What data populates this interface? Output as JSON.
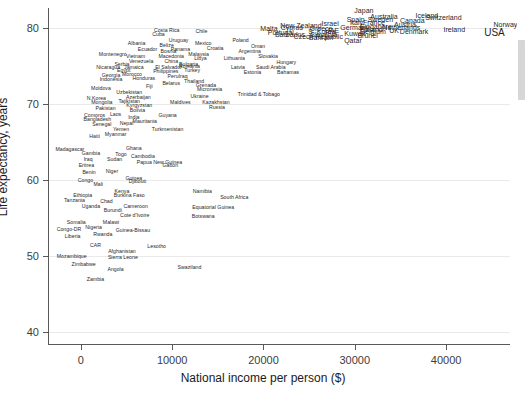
{
  "chart_data": {
    "type": "scatter",
    "title": "",
    "xlabel": "National income per person ($)",
    "ylabel": "Life expectancy, years",
    "xlim": [
      -3600,
      47000
    ],
    "ylim": [
      38.3,
      82.6
    ],
    "xticks": [
      0,
      10000,
      20000,
      30000,
      40000
    ],
    "xtick_labels": [
      "0",
      "10000",
      "20000",
      "30000",
      "40000"
    ],
    "yticks": [
      40,
      50,
      60,
      70,
      80
    ],
    "ytick_labels": [
      "40",
      "50",
      "60",
      "70",
      "80"
    ],
    "grid": "horizontal",
    "legend": "none",
    "point_render": "text-labels-only",
    "points": [
      {
        "label": "Japan",
        "x": 31000,
        "y": 82.2,
        "size": "mid"
      },
      {
        "label": "Iceland",
        "x": 37900,
        "y": 81.6,
        "size": "mid"
      },
      {
        "label": "Australia",
        "x": 33200,
        "y": 81.4,
        "size": "mid"
      },
      {
        "label": "Switzerland",
        "x": 39700,
        "y": 81.3,
        "size": "mid"
      },
      {
        "label": "Spain",
        "x": 30100,
        "y": 81.0,
        "size": "mid"
      },
      {
        "label": "Sweden",
        "x": 32800,
        "y": 81.0,
        "size": "mid"
      },
      {
        "label": "Canada",
        "x": 36300,
        "y": 80.9,
        "size": "mid"
      },
      {
        "label": "Italy",
        "x": 30200,
        "y": 80.6,
        "size": "mid"
      },
      {
        "label": "France",
        "x": 32100,
        "y": 80.6,
        "size": "mid"
      },
      {
        "label": "Israel",
        "x": 27300,
        "y": 80.5,
        "size": "mid"
      },
      {
        "label": "Austria",
        "x": 35500,
        "y": 80.4,
        "size": "mid"
      },
      {
        "label": "Norway",
        "x": 46500,
        "y": 80.3,
        "size": "mid"
      },
      {
        "label": "Singapore",
        "x": 32300,
        "y": 80.1,
        "size": "mid"
      },
      {
        "label": "Germany",
        "x": 30000,
        "y": 80.0,
        "size": "mid"
      },
      {
        "label": "Netherlands",
        "x": 35100,
        "y": 80.0,
        "size": "mid"
      },
      {
        "label": "New Zealand",
        "x": 24100,
        "y": 80.2,
        "size": "mid"
      },
      {
        "label": "Greece",
        "x": 26300,
        "y": 79.9,
        "size": "mid"
      },
      {
        "label": "Finland",
        "x": 31800,
        "y": 79.7,
        "size": "mid"
      },
      {
        "label": "Ireland",
        "x": 40900,
        "y": 79.7,
        "size": "mid"
      },
      {
        "label": "USA",
        "x": 45300,
        "y": 79.4,
        "size": "big"
      },
      {
        "label": "Cyprus",
        "x": 23100,
        "y": 80.0,
        "size": "mid"
      },
      {
        "label": "Malta",
        "x": 20600,
        "y": 79.9,
        "size": "mid"
      },
      {
        "label": "UK",
        "x": 34300,
        "y": 79.6,
        "size": "mid"
      },
      {
        "label": "Denmark",
        "x": 36500,
        "y": 79.4,
        "size": "mid"
      },
      {
        "label": "UAE",
        "x": 27500,
        "y": 79.6,
        "size": "mid"
      },
      {
        "label": "Belgium",
        "x": 32000,
        "y": 79.4,
        "size": "mid"
      },
      {
        "label": "S. Korea",
        "x": 26400,
        "y": 79.4,
        "size": "mid"
      },
      {
        "label": "Kuwait",
        "x": 30000,
        "y": 79.2,
        "size": "mid"
      },
      {
        "label": "Portugal",
        "x": 21900,
        "y": 79.3,
        "size": "mid"
      },
      {
        "label": "Slovenia",
        "x": 26600,
        "y": 79.0,
        "size": "mid"
      },
      {
        "label": "Brunei",
        "x": 31400,
        "y": 78.9,
        "size": "mid"
      },
      {
        "label": "Czech Republic",
        "x": 26000,
        "y": 78.8,
        "size": "mid"
      },
      {
        "label": "Barbados",
        "x": 22900,
        "y": 79.1,
        "size": "mid"
      },
      {
        "label": "Bahrain",
        "x": 26300,
        "y": 78.6,
        "size": "mid"
      },
      {
        "label": "Qatar",
        "x": 29800,
        "y": 78.3,
        "size": "mid"
      },
      {
        "label": "Chile",
        "x": 13200,
        "y": 79.6,
        "size": "small"
      },
      {
        "label": "Costa Rica",
        "x": 9400,
        "y": 79.7,
        "size": "small"
      },
      {
        "label": "Cuba",
        "x": 8500,
        "y": 79.2,
        "size": "small"
      },
      {
        "label": "Uruguay",
        "x": 10700,
        "y": 78.4,
        "size": "small"
      },
      {
        "label": "Poland",
        "x": 17500,
        "y": 78.4,
        "size": "small"
      },
      {
        "label": "Albania",
        "x": 6100,
        "y": 78.0,
        "size": "small"
      },
      {
        "label": "Mexico",
        "x": 13400,
        "y": 78.0,
        "size": "small"
      },
      {
        "label": "Belize",
        "x": 9400,
        "y": 77.7,
        "size": "small"
      },
      {
        "label": "Oman",
        "x": 19400,
        "y": 77.6,
        "size": "small"
      },
      {
        "label": "Panama",
        "x": 10900,
        "y": 77.2,
        "size": "small"
      },
      {
        "label": "Croatia",
        "x": 14700,
        "y": 77.3,
        "size": "small"
      },
      {
        "label": "Argentina",
        "x": 18500,
        "y": 77.0,
        "size": "small"
      },
      {
        "label": "Ecuador",
        "x": 7300,
        "y": 77.2,
        "size": "small"
      },
      {
        "label": "Bosnia",
        "x": 9600,
        "y": 76.9,
        "size": "small"
      },
      {
        "label": "Montenegro",
        "x": 3500,
        "y": 76.6,
        "size": "small"
      },
      {
        "label": "Malaysia",
        "x": 12900,
        "y": 76.5,
        "size": "small"
      },
      {
        "label": "Macedonia",
        "x": 9900,
        "y": 76.3,
        "size": "small"
      },
      {
        "label": "Slovakia",
        "x": 20500,
        "y": 76.3,
        "size": "small"
      },
      {
        "label": "Vietnam",
        "x": 6000,
        "y": 76.3,
        "size": "small"
      },
      {
        "label": "Libya",
        "x": 13100,
        "y": 76.0,
        "size": "small"
      },
      {
        "label": "Lithuania",
        "x": 16800,
        "y": 76.0,
        "size": "small"
      },
      {
        "label": "China",
        "x": 9900,
        "y": 75.6,
        "size": "small"
      },
      {
        "label": "Venezuela",
        "x": 6600,
        "y": 75.6,
        "size": "small"
      },
      {
        "label": "Hungary",
        "x": 22500,
        "y": 75.5,
        "size": "small"
      },
      {
        "label": "Bulgaria",
        "x": 11800,
        "y": 75.3,
        "size": "small"
      },
      {
        "label": "Serbia",
        "x": 4500,
        "y": 75.2,
        "size": "small"
      },
      {
        "label": "Romania",
        "x": 11900,
        "y": 75.0,
        "size": "small"
      },
      {
        "label": "Nicaragua",
        "x": 3000,
        "y": 74.9,
        "size": "small"
      },
      {
        "label": "Jamaica",
        "x": 5800,
        "y": 74.9,
        "size": "small"
      },
      {
        "label": "El Salvador",
        "x": 9600,
        "y": 74.8,
        "size": "small"
      },
      {
        "label": "Latvia",
        "x": 17200,
        "y": 74.8,
        "size": "small"
      },
      {
        "label": "Saudi Arabia",
        "x": 20800,
        "y": 74.8,
        "size": "small"
      },
      {
        "label": "Turkey",
        "x": 12200,
        "y": 74.4,
        "size": "small"
      },
      {
        "label": "Egypt",
        "x": 4700,
        "y": 74.4,
        "size": "small"
      },
      {
        "label": "Philippines",
        "x": 9300,
        "y": 74.3,
        "size": "small"
      },
      {
        "label": "Estonia",
        "x": 18800,
        "y": 74.2,
        "size": "small"
      },
      {
        "label": "Bahamas",
        "x": 22700,
        "y": 74.2,
        "size": "small"
      },
      {
        "label": "Morocco",
        "x": 5600,
        "y": 73.9,
        "size": "small"
      },
      {
        "label": "Georgia",
        "x": 3300,
        "y": 73.8,
        "size": "small"
      },
      {
        "label": "Iraq",
        "x": 11200,
        "y": 73.6,
        "size": "small"
      },
      {
        "label": "Peru",
        "x": 10100,
        "y": 73.6,
        "size": "small"
      },
      {
        "label": "Honduras",
        "x": 6900,
        "y": 73.4,
        "size": "small"
      },
      {
        "label": "Indonesia",
        "x": 3300,
        "y": 73.3,
        "size": "small"
      },
      {
        "label": "Thailand",
        "x": 12400,
        "y": 73.0,
        "size": "small"
      },
      {
        "label": "Belarus",
        "x": 9900,
        "y": 72.7,
        "size": "small"
      },
      {
        "label": "Grenada",
        "x": 13700,
        "y": 72.5,
        "size": "small"
      },
      {
        "label": "Fiji",
        "x": 7500,
        "y": 72.4,
        "size": "small"
      },
      {
        "label": "Moldova",
        "x": 2200,
        "y": 72.1,
        "size": "small"
      },
      {
        "label": "Micronesia",
        "x": 14100,
        "y": 71.9,
        "size": "small"
      },
      {
        "label": "Uzbekistan",
        "x": 5300,
        "y": 71.6,
        "size": "small"
      },
      {
        "label": "Trinidad & Tobago",
        "x": 19500,
        "y": 71.3,
        "size": "small"
      },
      {
        "label": "Ukraine",
        "x": 13000,
        "y": 71.0,
        "size": "small"
      },
      {
        "label": "Azerbaijan",
        "x": 6300,
        "y": 70.9,
        "size": "small"
      },
      {
        "label": "N.Korea",
        "x": 1700,
        "y": 70.8,
        "size": "small"
      },
      {
        "label": "Tajikistan",
        "x": 5300,
        "y": 70.4,
        "size": "small"
      },
      {
        "label": "Maldives",
        "x": 10900,
        "y": 70.3,
        "size": "small"
      },
      {
        "label": "Kazakhstan",
        "x": 14800,
        "y": 70.3,
        "size": "small"
      },
      {
        "label": "Mongolia",
        "x": 2300,
        "y": 70.2,
        "size": "small"
      },
      {
        "label": "Kyrgyzstan",
        "x": 6400,
        "y": 69.8,
        "size": "small"
      },
      {
        "label": "Russia",
        "x": 14900,
        "y": 69.6,
        "size": "small"
      },
      {
        "label": "Pakistan",
        "x": 2700,
        "y": 69.4,
        "size": "small"
      },
      {
        "label": "Bolivia",
        "x": 6200,
        "y": 69.2,
        "size": "small"
      },
      {
        "label": "Laos",
        "x": 3800,
        "y": 68.7,
        "size": "small"
      },
      {
        "label": "Comoros",
        "x": 1500,
        "y": 68.6,
        "size": "small"
      },
      {
        "label": "Guyana",
        "x": 9500,
        "y": 68.6,
        "size": "small"
      },
      {
        "label": "India",
        "x": 5800,
        "y": 68.3,
        "size": "small"
      },
      {
        "label": "Bangladesh",
        "x": 1800,
        "y": 68.0,
        "size": "small"
      },
      {
        "label": "Mauritania",
        "x": 7000,
        "y": 67.8,
        "size": "small"
      },
      {
        "label": "Nepal",
        "x": 5000,
        "y": 67.5,
        "size": "small"
      },
      {
        "label": "Senegal",
        "x": 2300,
        "y": 67.3,
        "size": "small"
      },
      {
        "label": "Yemen",
        "x": 4400,
        "y": 66.7,
        "size": "small"
      },
      {
        "label": "Turkmenistan",
        "x": 9500,
        "y": 66.7,
        "size": "small"
      },
      {
        "label": "Myanmar",
        "x": 3800,
        "y": 66.0,
        "size": "small"
      },
      {
        "label": "Haiti",
        "x": 1500,
        "y": 65.8,
        "size": "small"
      },
      {
        "label": "Madagascar",
        "x": -1200,
        "y": 64.0,
        "size": "small"
      },
      {
        "label": "Ghana",
        "x": 5800,
        "y": 64.2,
        "size": "small"
      },
      {
        "label": "Gambia",
        "x": 1100,
        "y": 63.6,
        "size": "small"
      },
      {
        "label": "Togo",
        "x": 4400,
        "y": 63.4,
        "size": "small"
      },
      {
        "label": "Cambodia",
        "x": 6800,
        "y": 63.1,
        "size": "small"
      },
      {
        "label": "Iraq2",
        "x": 800,
        "y": 62.7,
        "size": "small"
      },
      {
        "label": "Sudan",
        "x": 3700,
        "y": 62.7,
        "size": "small"
      },
      {
        "label": "Papua New Guinea",
        "x": 8600,
        "y": 62.4,
        "size": "small"
      },
      {
        "label": "Eritrea",
        "x": 600,
        "y": 62.0,
        "size": "small"
      },
      {
        "label": "Gabon",
        "x": 9800,
        "y": 61.9,
        "size": "small"
      },
      {
        "label": "Niger",
        "x": 3400,
        "y": 61.2,
        "size": "small"
      },
      {
        "label": "Benin",
        "x": 900,
        "y": 61.1,
        "size": "small"
      },
      {
        "label": "Guinea",
        "x": 5800,
        "y": 60.3,
        "size": "small"
      },
      {
        "label": "Congo",
        "x": 500,
        "y": 60.0,
        "size": "small"
      },
      {
        "label": "Djibouti",
        "x": 6200,
        "y": 59.9,
        "size": "small"
      },
      {
        "label": "Mali",
        "x": 1900,
        "y": 59.4,
        "size": "small"
      },
      {
        "label": "Kenya",
        "x": 4500,
        "y": 58.6,
        "size": "small"
      },
      {
        "label": "Namibia",
        "x": 13300,
        "y": 58.5,
        "size": "small"
      },
      {
        "label": "Ethiopia",
        "x": 200,
        "y": 58.0,
        "size": "small"
      },
      {
        "label": "Burkina Faso",
        "x": 5300,
        "y": 58.0,
        "size": "small"
      },
      {
        "label": "South Africa",
        "x": 16800,
        "y": 57.8,
        "size": "small"
      },
      {
        "label": "Tanzania",
        "x": -700,
        "y": 57.3,
        "size": "small"
      },
      {
        "label": "Chad",
        "x": 2800,
        "y": 57.2,
        "size": "small"
      },
      {
        "label": "Uganda",
        "x": 1100,
        "y": 56.6,
        "size": "small"
      },
      {
        "label": "Cameroon",
        "x": 6000,
        "y": 56.6,
        "size": "small"
      },
      {
        "label": "Equatorial Guinea",
        "x": 14500,
        "y": 56.5,
        "size": "small"
      },
      {
        "label": "Burundi",
        "x": 3500,
        "y": 56.1,
        "size": "small"
      },
      {
        "label": "Cote d'Ivoire",
        "x": 5900,
        "y": 55.4,
        "size": "small"
      },
      {
        "label": "Botswana",
        "x": 13400,
        "y": 55.3,
        "size": "small"
      },
      {
        "label": "Somalia",
        "x": -500,
        "y": 54.5,
        "size": "small"
      },
      {
        "label": "Malawi",
        "x": 3300,
        "y": 54.5,
        "size": "small"
      },
      {
        "label": "Nigeria",
        "x": 1400,
        "y": 53.8,
        "size": "small"
      },
      {
        "label": "Congo-DR",
        "x": -1300,
        "y": 53.5,
        "size": "small"
      },
      {
        "label": "Guinea-Bissau",
        "x": 5700,
        "y": 53.4,
        "size": "small"
      },
      {
        "label": "Rwanda",
        "x": 2400,
        "y": 52.9,
        "size": "small"
      },
      {
        "label": "Liberia",
        "x": -900,
        "y": 52.6,
        "size": "small"
      },
      {
        "label": "CAR",
        "x": 1600,
        "y": 51.5,
        "size": "small"
      },
      {
        "label": "Lesotho",
        "x": 8300,
        "y": 51.3,
        "size": "small"
      },
      {
        "label": "Afghanistan",
        "x": 4500,
        "y": 50.7,
        "size": "small"
      },
      {
        "label": "Mozambique",
        "x": -1000,
        "y": 50.0,
        "size": "small"
      },
      {
        "label": "Sierra Leone",
        "x": 4600,
        "y": 49.9,
        "size": "small"
      },
      {
        "label": "Zimbabwe",
        "x": 300,
        "y": 48.9,
        "size": "small"
      },
      {
        "label": "Angola",
        "x": 3800,
        "y": 48.3,
        "size": "small"
      },
      {
        "label": "Swaziland",
        "x": 11900,
        "y": 48.5,
        "size": "small"
      },
      {
        "label": "Zambia",
        "x": 1600,
        "y": 47.0,
        "size": "small"
      }
    ]
  },
  "ui": {
    "scrollbar_name": "vertical-scrollbar"
  }
}
